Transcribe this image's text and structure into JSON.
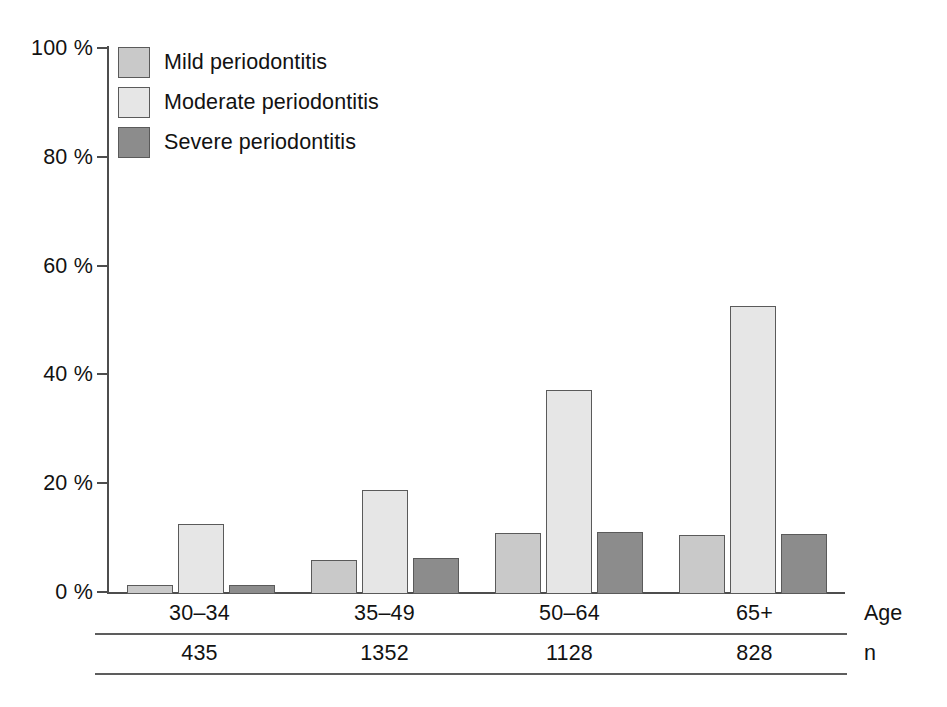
{
  "chart_data": {
    "type": "bar",
    "title": "",
    "subtitle": "",
    "xlabel": "Age",
    "ylabel": "",
    "categories": [
      "30–34",
      "35–49",
      "50–64",
      "65+"
    ],
    "series": [
      {
        "name": "Mild periodontitis",
        "values": [
          1.7,
          6.3,
          11.3,
          10.9
        ],
        "color": "#c9c9c9"
      },
      {
        "name": "Moderate periodontitis",
        "values": [
          12.8,
          19.2,
          37.5,
          53.0
        ],
        "color": "#e6e6e6"
      },
      {
        "name": "Severe periodontitis",
        "values": [
          1.7,
          6.6,
          11.4,
          11.0
        ],
        "color": "#8c8c8c"
      }
    ],
    "ylim": [
      0,
      100
    ],
    "yticks": [
      0,
      20,
      40,
      60,
      80,
      100
    ],
    "ytick_labels": [
      "0 %",
      "20 %",
      "40 %",
      "60 %",
      "80 %",
      "100 %"
    ],
    "grid": false,
    "legend_position": "top-left",
    "value_unit": "%",
    "sample_sizes": [
      "435",
      "1352",
      "1128",
      "828"
    ],
    "sample_size_label": "n"
  },
  "legend": {
    "items": [
      {
        "label": "Mild periodontitis"
      },
      {
        "label": "Moderate periodontitis"
      },
      {
        "label": "Severe periodontitis"
      }
    ]
  },
  "axis": {
    "y_labels": [
      "100 %",
      "80 %",
      "60 %",
      "40 %",
      "20 %",
      "0 %"
    ]
  },
  "table": {
    "age_label": "Age",
    "n_label": "n",
    "age_values": [
      "30–34",
      "35–49",
      "50–64",
      "65+"
    ],
    "n_values": [
      "435",
      "1352",
      "1128",
      "828"
    ]
  }
}
